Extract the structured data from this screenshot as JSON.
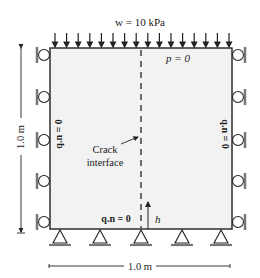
{
  "diagram": {
    "load_label": "w = 10 kPa",
    "top_bc_label": "p = 0",
    "left_bc_label": "q.n = 0",
    "right_bc_label": "q.n = 0",
    "bottom_bc_label": "q.n = 0",
    "crack_label_line1": "Crack",
    "crack_label_line2": "interface",
    "crack_height_label": "h",
    "height_dim_label": "1.0 m",
    "width_dim_label": "1.0 m",
    "colors": {
      "domain_fill": "#f2f2f2",
      "stroke": "#222222",
      "hatch": "#777777"
    }
  }
}
